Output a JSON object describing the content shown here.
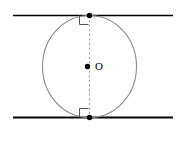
{
  "figure": {
    "type": "geometry-diagram",
    "background_color": "#ffffff",
    "labels": {
      "center_point": "O"
    },
    "colors": {
      "line_stroke": "#000000",
      "circle_stroke": "#8a8a8a",
      "dashed_stroke": "#9a9a9a",
      "point_fill": "#000000",
      "angle_mark_stroke": "#555555"
    },
    "geometry": {
      "canvas": {
        "width": 188,
        "height": 145
      },
      "top_line": {
        "x1": 13,
        "y1": 15.5,
        "x2": 173,
        "y2": 15.5,
        "stroke_width": 1.4
      },
      "bottom_line": {
        "x1": 13,
        "y1": 117.5,
        "x2": 173,
        "y2": 117.5,
        "stroke_width": 1.8
      },
      "circle": {
        "cx": 89.5,
        "cy": 66.5,
        "rx": 47,
        "ry": 51,
        "stroke_width": 1.1
      },
      "diameter_dashed": {
        "x1": 89.5,
        "y1": 15.5,
        "x2": 89.5,
        "y2": 117.5,
        "dash": "2,2.6",
        "stroke_width": 1
      },
      "points": [
        {
          "name": "top-tangent-point",
          "cx": 89.5,
          "cy": 15.5,
          "r": 2.6
        },
        {
          "name": "center-point",
          "cx": 87.5,
          "cy": 66.5,
          "r": 2.6
        },
        {
          "name": "bottom-tangent-point",
          "cx": 89.5,
          "cy": 117.5,
          "r": 2.6
        }
      ],
      "right_angle_marks": [
        {
          "name": "top-right-angle-mark",
          "x": 79.5,
          "y": 15.5,
          "size": 9,
          "direction": "down-left"
        },
        {
          "name": "bottom-right-angle-mark",
          "x": 79.5,
          "y": 117.5,
          "size": 9,
          "direction": "up-left"
        }
      ],
      "center_label_pos": {
        "x": 95,
        "y": 67
      }
    }
  }
}
